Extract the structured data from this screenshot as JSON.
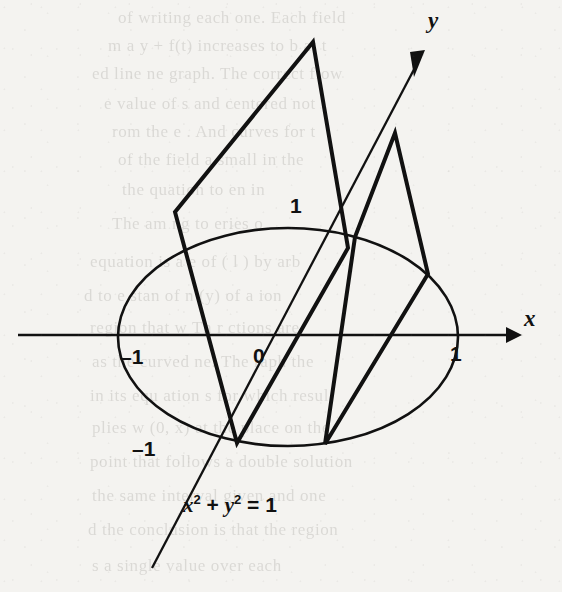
{
  "figure": {
    "kind": "math-diagram",
    "caption_equation": "x² + y² = 1",
    "background_color": "#f4f3f0",
    "ink_color": "#111111"
  },
  "axes": {
    "x_axis_label": "x",
    "y_axis_label": "y",
    "origin_label": "0",
    "x_tick_negative_label": "–1",
    "x_tick_positive_label": "1",
    "y_tick_positive_label": "1",
    "y_tick_negative_label": "–1",
    "x_axis_line": {
      "x1": 18,
      "y1": 335,
      "x2": 512,
      "y2": 335
    },
    "y_axis_line": {
      "x1": 152,
      "y1": 568,
      "x2": 424,
      "y2": 52
    }
  },
  "chart_data": {
    "type": "scatter",
    "title": "",
    "xlabel": "x",
    "ylabel": "y",
    "annotations": [
      {
        "text": "x² + y² = 1",
        "x": 185,
        "y": 505,
        "role": "curve-equation"
      },
      {
        "text": "0",
        "x": 262,
        "y": 350,
        "role": "origin-tick"
      },
      {
        "text": "–1",
        "x": 130,
        "y": 345,
        "role": "x-tick"
      },
      {
        "text": "1",
        "x": 452,
        "y": 345,
        "role": "x-tick"
      },
      {
        "text": "1",
        "x": 290,
        "y": 194,
        "role": "y-tick"
      },
      {
        "text": "–1",
        "x": 136,
        "y": 437,
        "role": "y-tick"
      },
      {
        "text": "x",
        "x": 525,
        "y": 322,
        "role": "axis-name"
      },
      {
        "text": "y",
        "x": 429,
        "y": 18,
        "role": "axis-name"
      }
    ],
    "ellipse": {
      "label": "unit circle x² + y² = 1 drawn in oblique projection",
      "cx": 288,
      "cy": 337,
      "rx": 170,
      "ry": 109
    },
    "surfaces": [
      {
        "name": "left-fin",
        "points": [
          [
            313,
            42
          ],
          [
            175,
            212
          ],
          [
            237,
            443
          ],
          [
            348,
            248
          ]
        ]
      },
      {
        "name": "right-fin",
        "points": [
          [
            395,
            133
          ],
          [
            355,
            237
          ],
          [
            325,
            444
          ],
          [
            428,
            274
          ]
        ]
      }
    ]
  },
  "ghost_text": {
    "lines": [
      {
        "text": "of writing    each one. Each field",
        "x": 118,
        "y": 8
      },
      {
        "text": "m a   y + f(t)  increases to  b at t",
        "x": 108,
        "y": 36
      },
      {
        "text": "ed line    ne graph. The correct flow",
        "x": 92,
        "y": 64
      },
      {
        "text": "e value of    s and  centered not",
        "x": 104,
        "y": 94
      },
      {
        "text": "rom the   e    . And curves for t",
        "x": 112,
        "y": 122
      },
      {
        "text": "of the field    a small  in the",
        "x": 118,
        "y": 150
      },
      {
        "text": "the   quation     to  en in",
        "x": 122,
        "y": 180
      },
      {
        "text": "The  am  ng    to  eries o",
        "x": 112,
        "y": 214
      },
      {
        "text": "equation is   a   e of   ( l )  by  arb",
        "x": 90,
        "y": 252
      },
      {
        "text": "d to  e   stan      of     n  (y) of a  ion",
        "x": 84,
        "y": 286
      },
      {
        "text": "region that  w     Th   r  ctions are",
        "x": 90,
        "y": 318
      },
      {
        "text": "as the curved   ne. The  raph  the",
        "x": 92,
        "y": 352
      },
      {
        "text": "in its  equ  ation  s for  which resul",
        "x": 90,
        "y": 386
      },
      {
        "text": "plies   w  (0, x)  at  the  place on the",
        "x": 92,
        "y": 418
      },
      {
        "text": "point that   follows  a  double  solution",
        "x": 90,
        "y": 452
      },
      {
        "text": "the  same    interval   given  and  one",
        "x": 92,
        "y": 486
      },
      {
        "text": "d  the  conclusion   is  that  the  region",
        "x": 88,
        "y": 520
      },
      {
        "text": "s    a  single    value    over    each",
        "x": 92,
        "y": 556
      }
    ]
  }
}
